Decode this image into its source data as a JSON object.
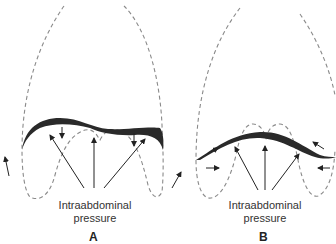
{
  "figure": {
    "panels": [
      {
        "id": "A",
        "label": "A",
        "caption_line1": "Intraabdominal",
        "caption_line2": "pressure"
      },
      {
        "id": "B",
        "label": "B",
        "caption_line1": "Intraabdominal",
        "caption_line2": "pressure"
      }
    ],
    "colors": {
      "diaphragm": "#2a2a2a",
      "dashed_outline": "#8a8a8a",
      "arrows": "#222222",
      "text": "#333333"
    }
  }
}
